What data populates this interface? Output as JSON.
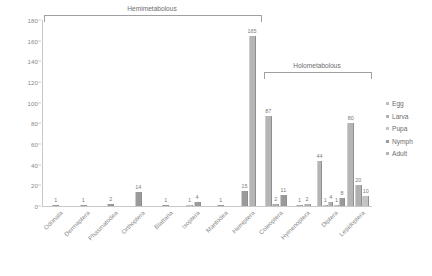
{
  "chart_data": {
    "type": "bar",
    "title": "",
    "xlabel": "",
    "ylabel": "",
    "ylim": [
      0,
      180
    ],
    "ytick_step": 20,
    "yticks": [
      0,
      20,
      40,
      60,
      80,
      100,
      120,
      140,
      160,
      180
    ],
    "grid": false,
    "legend_position": "right",
    "categories": [
      "Odonata",
      "Dermaptera",
      "Phasmatodea",
      "Orthoptera",
      "Blattaria",
      "Isoptera",
      "Mantodea",
      "Hemiptera",
      "Coleoptera",
      "Hymenoptera",
      "Diptera",
      "Lepidoptera"
    ],
    "series": [
      {
        "name": "Egg",
        "values": [
          0,
          0,
          0,
          0,
          0,
          1,
          0,
          0,
          0,
          0,
          1,
          0
        ]
      },
      {
        "name": "Larva",
        "values": [
          0,
          0,
          0,
          0,
          0,
          0,
          0,
          0,
          2,
          1,
          4,
          0
        ]
      },
      {
        "name": "Pupa",
        "values": [
          0,
          0,
          0,
          0,
          0,
          0,
          0,
          0,
          0,
          0,
          1,
          0
        ]
      },
      {
        "name": "Nymph",
        "values": [
          1,
          1,
          2,
          14,
          1,
          4,
          1,
          15,
          0,
          0,
          0,
          0
        ]
      },
      {
        "name": "Adult",
        "values": [
          0,
          0,
          0,
          0,
          0,
          0,
          0,
          165,
          87,
          11,
          44,
          80
        ]
      }
    ],
    "extra_bars": {
      "Lepidoptera_larva_20": 20,
      "Lepidoptera_pupa_10": 10
    },
    "groups": [
      {
        "label": "Hemimetabolous",
        "from": "Odonata",
        "to": "Hemiptera"
      },
      {
        "label": "Holometabolous",
        "from": "Coleoptera",
        "to": "Lepidoptera"
      }
    ]
  },
  "legend": {
    "items": [
      {
        "label": "Egg",
        "color": "#bfbfbf"
      },
      {
        "label": "Larva",
        "color": "#b0b0b0"
      },
      {
        "label": "Pupa",
        "color": "#c4c4c4"
      },
      {
        "label": "Nymph",
        "color": "#9a9a9a"
      },
      {
        "label": "Adult",
        "color": "#b5b5b5"
      }
    ]
  },
  "bars": [
    {
      "category": "Odonata",
      "items": [
        {
          "series": "Nymph",
          "value": 1,
          "label": "1"
        }
      ]
    },
    {
      "category": "Dermaptera",
      "items": [
        {
          "series": "Nymph",
          "value": 1,
          "label": "1"
        }
      ]
    },
    {
      "category": "Phasmatodea",
      "items": [
        {
          "series": "Nymph",
          "value": 2,
          "label": "2"
        }
      ]
    },
    {
      "category": "Orthoptera",
      "items": [
        {
          "series": "Nymph",
          "value": 14,
          "label": "14"
        }
      ]
    },
    {
      "category": "Blattaria",
      "items": [
        {
          "series": "Nymph",
          "value": 1,
          "label": "1"
        }
      ]
    },
    {
      "category": "Isoptera",
      "items": [
        {
          "series": "Egg",
          "value": 1,
          "label": "1"
        },
        {
          "series": "Nymph",
          "value": 4,
          "label": "4"
        }
      ]
    },
    {
      "category": "Mantodea",
      "items": [
        {
          "series": "Nymph",
          "value": 1,
          "label": "1"
        }
      ]
    },
    {
      "category": "Hemiptera",
      "items": [
        {
          "series": "Nymph",
          "value": 15,
          "label": "15"
        },
        {
          "series": "Adult",
          "value": 165,
          "label": "165"
        }
      ]
    },
    {
      "category": "Coleoptera",
      "items": [
        {
          "series": "Adult",
          "value": 87,
          "label": "87"
        },
        {
          "series": "Larva",
          "value": 2,
          "label": "2"
        },
        {
          "series": "Nymph",
          "value": 11,
          "label": "11"
        }
      ]
    },
    {
      "category": "Hymenoptera",
      "items": [
        {
          "series": "Larva",
          "value": 1,
          "label": "1"
        },
        {
          "series": "Adult",
          "value": 2,
          "label": "2"
        }
      ]
    },
    {
      "category": "Diptera",
      "items": [
        {
          "series": "Adult",
          "value": 44,
          "label": "44"
        },
        {
          "series": "Egg",
          "value": 1,
          "label": "1"
        },
        {
          "series": "Larva",
          "value": 4,
          "label": "4"
        },
        {
          "series": "Pupa",
          "value": 1,
          "label": "1"
        },
        {
          "series": "Nymph",
          "value": 8,
          "label": "8"
        }
      ]
    },
    {
      "category": "Lepidoptera",
      "items": [
        {
          "series": "Adult",
          "value": 80,
          "label": "80"
        },
        {
          "series": "Larva",
          "value": 20,
          "label": "20"
        },
        {
          "series": "Pupa",
          "value": 10,
          "label": "10"
        }
      ]
    }
  ],
  "groups": [
    {
      "name": "hemimetabolous",
      "label": "Hemimetabolous"
    },
    {
      "name": "holometabolous",
      "label": "Holometabolous"
    }
  ]
}
